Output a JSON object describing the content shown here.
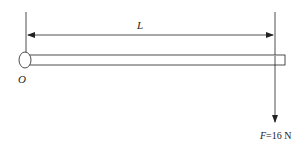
{
  "diagram": {
    "length_label": "L",
    "pivot_label": "O",
    "force_symbol": "F",
    "force_value": "=16 N",
    "colors": {
      "line": "#222222",
      "background": "#ffffff"
    }
  }
}
